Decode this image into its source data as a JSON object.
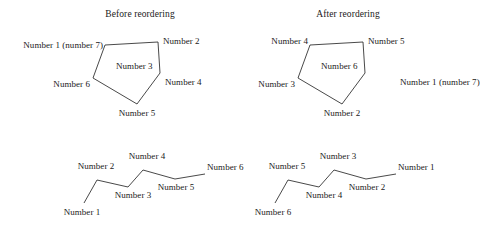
{
  "figure": {
    "stroke_color": "#1a1a1a",
    "background_color": "#ffffff",
    "panels": [
      {
        "id": "before-pentagon",
        "heading": "Before reordering",
        "heading_pos": {
          "x": 140,
          "y": 9
        },
        "shape": "pentagon",
        "points": "105,45 158,42 160,73 137,104 93,78",
        "labels": [
          {
            "name": "vertex-label-number-1",
            "text": "Number 1 (number 7)",
            "x": 103,
            "y": 40,
            "anchor": "right"
          },
          {
            "name": "vertex-label-number-2",
            "text": "Number 2",
            "x": 163,
            "y": 36,
            "anchor": "left"
          },
          {
            "name": "vertex-label-number-3",
            "text": "Number 3",
            "x": 116,
            "y": 61,
            "anchor": "left"
          },
          {
            "name": "vertex-label-number-4",
            "text": "Number 4",
            "x": 165,
            "y": 77,
            "anchor": "left"
          },
          {
            "name": "vertex-label-number-5",
            "text": "Number 5",
            "x": 137,
            "y": 108,
            "anchor": "center"
          },
          {
            "name": "vertex-label-number-6",
            "text": "Number 6",
            "x": 90,
            "y": 79,
            "anchor": "right"
          }
        ]
      },
      {
        "id": "after-pentagon",
        "heading": "After reordering",
        "heading_pos": {
          "x": 348,
          "y": 9
        },
        "shape": "pentagon",
        "points": "310,45 363,42 365,73 342,104 298,78",
        "labels": [
          {
            "name": "vertex-label-number-4",
            "text": "Number 4",
            "x": 308,
            "y": 36,
            "anchor": "right"
          },
          {
            "name": "vertex-label-number-5",
            "text": "Number 5",
            "x": 368,
            "y": 36,
            "anchor": "left"
          },
          {
            "name": "vertex-label-number-6",
            "text": "Number 6",
            "x": 321,
            "y": 61,
            "anchor": "left"
          },
          {
            "name": "vertex-label-number-1",
            "text": "Number 1 (number 7)",
            "x": 400,
            "y": 77,
            "anchor": "left"
          },
          {
            "name": "vertex-label-number-2",
            "text": "Number 2",
            "x": 342,
            "y": 108,
            "anchor": "center"
          },
          {
            "name": "vertex-label-number-3",
            "text": "Number 3",
            "x": 295,
            "y": 79,
            "anchor": "right"
          }
        ]
      },
      {
        "id": "before-polyline",
        "shape": "polyline",
        "points": "84,203 97,180 128,187 143,170 175,179 205,174",
        "labels": [
          {
            "name": "vertex-label-number-1",
            "text": "Number 1",
            "x": 82,
            "y": 207,
            "anchor": "center"
          },
          {
            "name": "vertex-label-number-2",
            "text": "Number 2",
            "x": 96,
            "y": 161,
            "anchor": "center"
          },
          {
            "name": "vertex-label-number-3",
            "text": "Number 3",
            "x": 133,
            "y": 190,
            "anchor": "center"
          },
          {
            "name": "vertex-label-number-4",
            "text": "Number 4",
            "x": 147,
            "y": 151,
            "anchor": "center"
          },
          {
            "name": "vertex-label-number-5",
            "text": "Number 5",
            "x": 176,
            "y": 182,
            "anchor": "center"
          },
          {
            "name": "vertex-label-number-6",
            "text": "Number 6",
            "x": 207,
            "y": 162,
            "anchor": "left"
          }
        ]
      },
      {
        "id": "after-polyline",
        "shape": "polyline",
        "points": "275,203 288,180 319,187 334,170 366,179 396,174",
        "labels": [
          {
            "name": "vertex-label-number-6",
            "text": "Number 6",
            "x": 273,
            "y": 207,
            "anchor": "center"
          },
          {
            "name": "vertex-label-number-5",
            "text": "Number 5",
            "x": 287,
            "y": 161,
            "anchor": "center"
          },
          {
            "name": "vertex-label-number-4",
            "text": "Number 4",
            "x": 324,
            "y": 190,
            "anchor": "center"
          },
          {
            "name": "vertex-label-number-3",
            "text": "Number 3",
            "x": 338,
            "y": 151,
            "anchor": "center"
          },
          {
            "name": "vertex-label-number-2",
            "text": "Number 2",
            "x": 367,
            "y": 182,
            "anchor": "center"
          },
          {
            "name": "vertex-label-number-1",
            "text": "Number 1",
            "x": 398,
            "y": 162,
            "anchor": "left"
          }
        ]
      }
    ]
  }
}
